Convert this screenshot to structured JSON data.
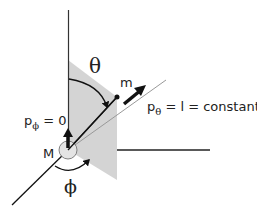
{
  "diagram": {
    "labels": {
      "theta": "θ",
      "phi": "ϕ",
      "small_mass": "m",
      "large_mass": "M",
      "p_theta_base": "p",
      "p_theta_sub": "θ",
      "p_theta_rest": " = l = constant",
      "p_phi_base": "p",
      "p_phi_sub": "ϕ",
      "p_phi_rest": " = 0"
    },
    "colors": {
      "plane_fill": "#d4d4d4",
      "line": "#111111",
      "light_line": "#999999",
      "mass_fill": "#e4e4e4"
    }
  }
}
